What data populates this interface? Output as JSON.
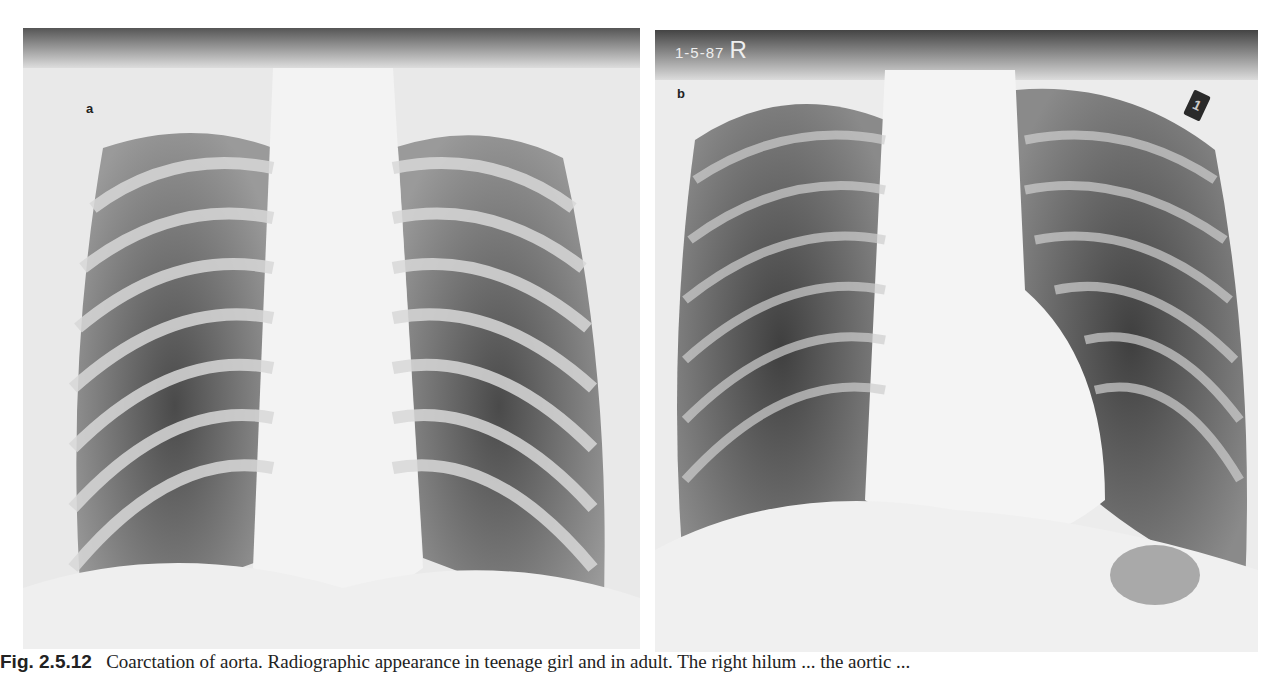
{
  "figure": {
    "panels": [
      {
        "id": "a",
        "label": "a",
        "description": "Frontal chest radiograph, younger patient, scanned panel with handwritten scribble at top-left"
      },
      {
        "id": "b",
        "label": "b",
        "film_marking_date": "1-5-87",
        "film_marking_side": "R",
        "marker_glyph": "1",
        "description": "Frontal chest radiograph, adult patient, with gastric air bubble under left hemidiaphragm"
      }
    ],
    "caption": {
      "number": "Fig. 2.5.12",
      "text": "Coarctation of aorta. Radiographic appearance in teenage girl and in adult. The right hilum ... the aortic ..."
    }
  },
  "colors": {
    "background": "#ffffff",
    "film_light": "#f2f2f2",
    "film_dark": "#3a3a3a",
    "caption_text": "#222222"
  }
}
